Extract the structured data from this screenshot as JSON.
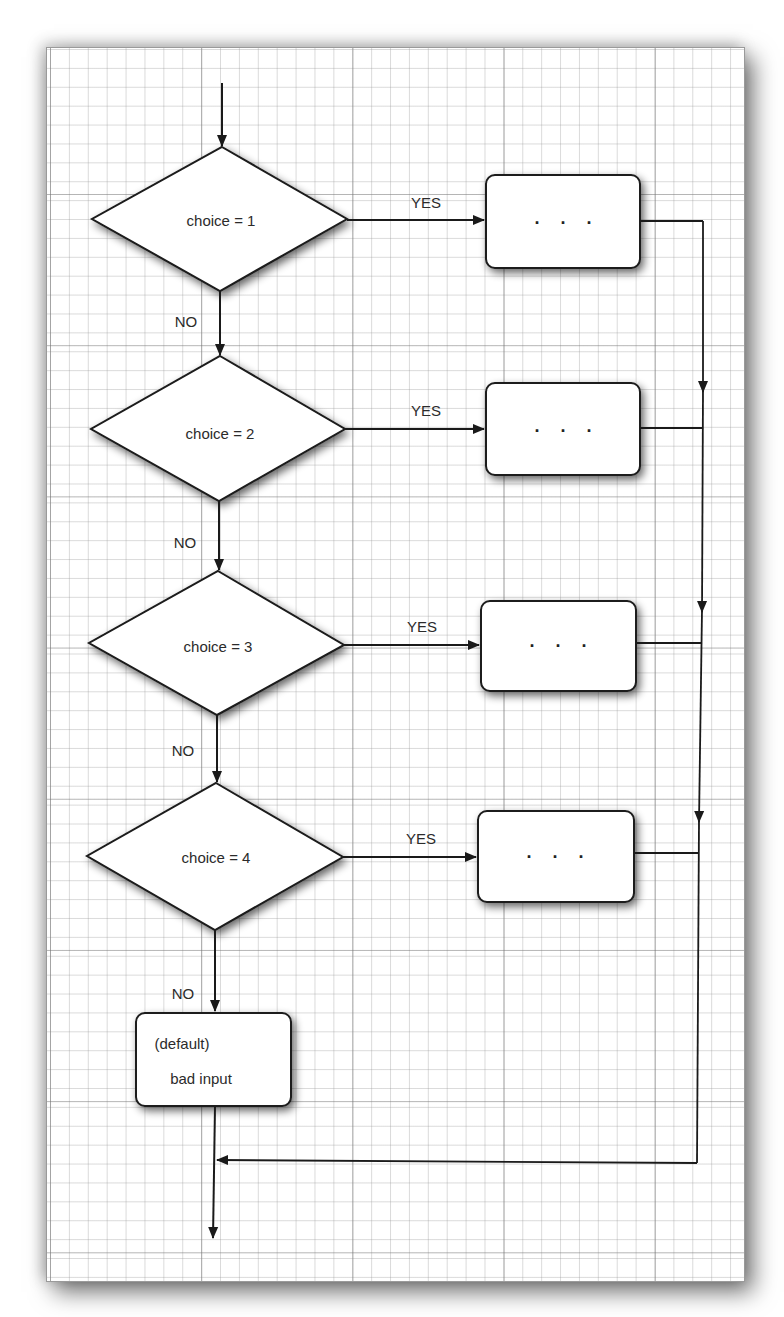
{
  "diagram": {
    "type": "flowchart",
    "decisions": [
      {
        "label": "choice = 1",
        "yes": "YES",
        "no": "NO",
        "action": ". . ."
      },
      {
        "label": "choice = 2",
        "yes": "YES",
        "no": "NO",
        "action": ". . ."
      },
      {
        "label": "choice = 3",
        "yes": "YES",
        "no": "NO",
        "action": ". . ."
      },
      {
        "label": "choice = 4",
        "yes": "YES",
        "no": "NO",
        "action": ". . ."
      }
    ],
    "default_box": {
      "line1": "(default)",
      "line2": "bad input"
    },
    "colors": {
      "stroke": "#1a1a1a",
      "fill": "#ffffff",
      "grid": "#9a9a9a"
    }
  }
}
